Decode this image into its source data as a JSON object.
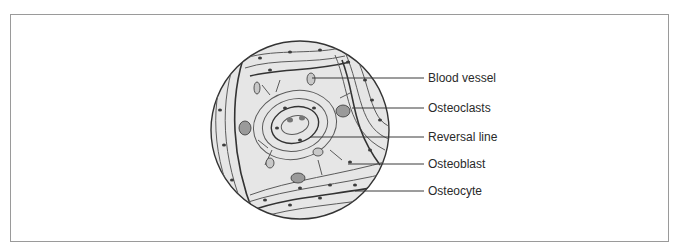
{
  "figure": {
    "type": "histology-illustration",
    "labels": [
      {
        "id": "blood-vessel",
        "text": "Blood vessel",
        "y": 78,
        "line_from_x": 312
      },
      {
        "id": "osteoclasts",
        "text": "Osteoclasts",
        "y": 108,
        "line_from_x": 352
      },
      {
        "id": "reversal-line",
        "text": "Reversal line",
        "y": 137,
        "line_from_x": 310
      },
      {
        "id": "osteoblast",
        "text": "Osteoblast",
        "y": 164,
        "line_from_x": 348
      },
      {
        "id": "osteocyte",
        "text": "Osteocyte",
        "y": 191,
        "line_from_x": 355
      }
    ],
    "colors": {
      "border": "#9a9a9a",
      "leader_line": "#3a3a3a",
      "circle_fill": "#e4e4e4",
      "lamella_stroke": "#555555",
      "cell_fill": "#3c3c3c",
      "text": "#2a2a2a"
    }
  }
}
